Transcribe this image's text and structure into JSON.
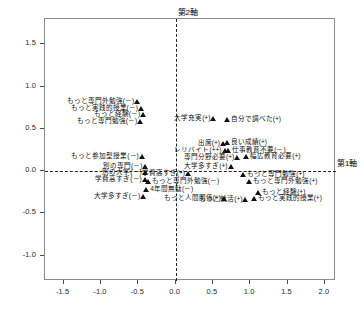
{
  "chart_data": {
    "type": "scatter",
    "title": "",
    "xlabel": "第1軸",
    "ylabel": "第2軸",
    "xlim": [
      -1.75,
      2.15
    ],
    "ylim": [
      -1.3,
      1.8
    ],
    "grid": false,
    "legend": "none",
    "reference_lines": {
      "x": 0.0,
      "y": 0.0,
      "style": "dashed"
    },
    "xticks": [
      "-1.5",
      "-1.0",
      "-0.5",
      "0.0",
      "0.5",
      "1.0",
      "1.5",
      "2.0"
    ],
    "xtick_values": [
      -1.5,
      -1.0,
      -0.5,
      0.0,
      0.5,
      1.0,
      1.5,
      2.0
    ],
    "yticks": [
      "1.5",
      "1.0",
      "0.5",
      "0.0",
      "-0.5",
      "-1.0"
    ],
    "ytick_values": [
      1.5,
      1.0,
      0.5,
      0.0,
      -0.5,
      -1.0
    ],
    "points": [
      {
        "label": "もっと専門外勉強(－)",
        "x": -0.5,
        "y": 0.78,
        "side": "r"
      },
      {
        "label": "もっと実践的授業(－)",
        "x": -0.45,
        "y": 0.7,
        "side": "r"
      },
      {
        "label": "もっと経験(－)",
        "x": -0.42,
        "y": 0.63,
        "side": "r"
      },
      {
        "label": "もっと専門勉強(－)",
        "x": -0.46,
        "y": 0.55,
        "side": "r"
      },
      {
        "label": "大学充実(+)",
        "x": 0.52,
        "y": 0.58,
        "side": "r"
      },
      {
        "label": "自分で調べた(+)",
        "x": 0.7,
        "y": 0.57,
        "side": "l"
      },
      {
        "label": "出席(+)",
        "x": 0.65,
        "y": 0.29,
        "side": "r"
      },
      {
        "label": "良い成績(+)",
        "x": 0.7,
        "y": 0.3,
        "side": "l"
      },
      {
        "label": "レリバイト(++)",
        "x": 0.67,
        "y": 0.2,
        "side": "r"
      },
      {
        "label": "仕事教育不要(－)",
        "x": 0.72,
        "y": 0.2,
        "side": "l"
      },
      {
        "label": "もっと参加型授業(－)",
        "x": -0.44,
        "y": 0.13,
        "side": "r"
      },
      {
        "label": "専門分野必要(+)",
        "x": 0.84,
        "y": 0.12,
        "side": "r"
      },
      {
        "label": "幅広教育必要(+)",
        "x": 0.96,
        "y": 0.13,
        "side": "l"
      },
      {
        "label": "別の専門(－)",
        "x": -0.39,
        "y": 0.01,
        "side": "r"
      },
      {
        "label": "大学多すぎ(+)",
        "x": 0.75,
        "y": 0.01,
        "side": "r"
      },
      {
        "label": "別の大学(－)",
        "x": -0.4,
        "y": -0.06,
        "side": "r"
      },
      {
        "label": "学費高すぎ(+)",
        "x": 0.18,
        "y": -0.07,
        "side": "r"
      },
      {
        "label": "もっと専門勉強(+)",
        "x": 0.92,
        "y": -0.08,
        "side": "l"
      },
      {
        "label": "学費高すぎ(－)",
        "x": -0.4,
        "y": -0.14,
        "side": "r"
      },
      {
        "label": "もっと専門外勉強(－)",
        "x": -0.36,
        "y": -0.16,
        "side": "l"
      },
      {
        "label": "もっと専門外勉強(+)",
        "x": 1.0,
        "y": -0.17,
        "side": "l"
      },
      {
        "label": "4年間無駄(－)",
        "x": -0.38,
        "y": -0.26,
        "side": "l"
      },
      {
        "label": "もっと経験(+)",
        "x": 1.12,
        "y": -0.3,
        "side": "l"
      },
      {
        "label": "大学多すぎ(－)",
        "x": -0.42,
        "y": -0.34,
        "side": "r"
      },
      {
        "label": "もっと人間関係(+)",
        "x": 0.66,
        "y": -0.36,
        "side": "r"
      },
      {
        "label": "もっと実践的授業(+)",
        "x": 1.06,
        "y": -0.36,
        "side": "l"
      },
      {
        "label": "もっと就活(+)",
        "x": 0.95,
        "y": -0.38,
        "side": "r"
      }
    ]
  },
  "axis_tags": {
    "vertical": "第2軸",
    "horizontal": "第1軸"
  },
  "caption": ""
}
